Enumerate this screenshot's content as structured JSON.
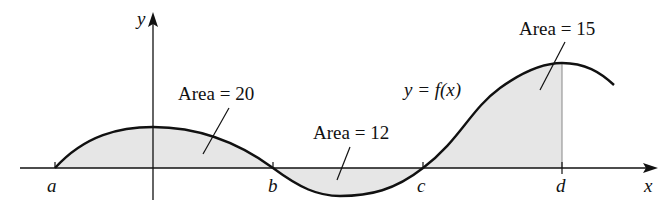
{
  "axes": {
    "x_label": "x",
    "y_label": "y"
  },
  "points": {
    "a": "a",
    "b": "b",
    "c": "c",
    "d": "d"
  },
  "curve_label": "y = f(x)",
  "areas": [
    {
      "label": "Area = 20",
      "region": "a to b",
      "sign": "above"
    },
    {
      "label": "Area = 12",
      "region": "b to c",
      "sign": "below"
    },
    {
      "label": "Area = 15",
      "region": "c to d",
      "sign": "above"
    }
  ],
  "colors": {
    "fill": "#e6e6e6",
    "stroke": "#111111"
  }
}
